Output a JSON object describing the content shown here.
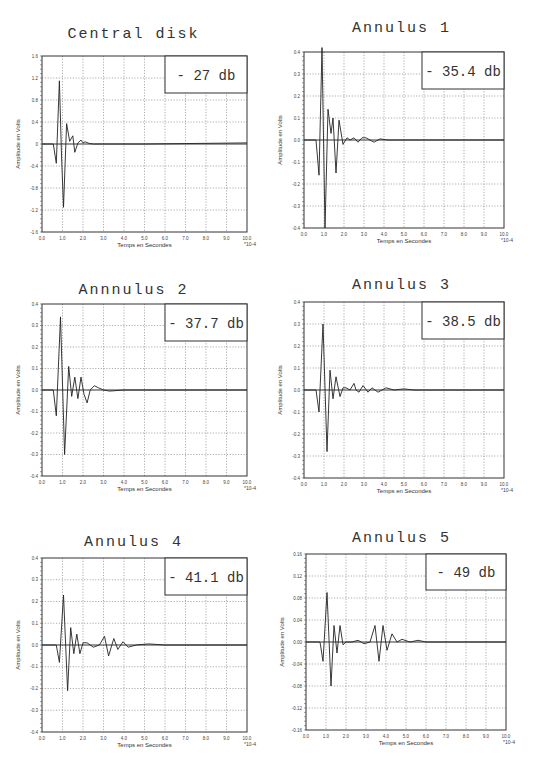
{
  "figure": {
    "xlabel": "Temps en Secondes",
    "ylabel": "Amplitude en Volts",
    "x_multiplier": "*10^-4"
  },
  "chart_data": [
    {
      "type": "line",
      "title": "Central disk",
      "annotation": "- 27 db",
      "xlabel": "Temps en Secondes",
      "ylabel": "Amplitude en Volts",
      "x_multiplier": "*10^-4",
      "xlim": [
        0,
        10
      ],
      "ylim": [
        -1.6,
        1.6
      ],
      "xticks": [
        "0.0",
        "1.0",
        "2.0",
        "3.0",
        "4.0",
        "5.0",
        "6.0",
        "7.0",
        "8.0",
        "9.0",
        "10.0"
      ],
      "yticks": [
        "1.6",
        "1.2",
        "0.8",
        "0.4",
        "0",
        "-0.4",
        "-0.8",
        "-1.2",
        "-1.6"
      ],
      "grid": true,
      "series": [
        {
          "name": "signal",
          "x": [
            0,
            0.55,
            0.7,
            0.85,
            0.95,
            1.05,
            1.2,
            1.35,
            1.5,
            1.6,
            1.75,
            1.9,
            2.0,
            2.1,
            2.3,
            2.5,
            3,
            5,
            10
          ],
          "y": [
            0,
            0,
            -0.35,
            1.15,
            -0.2,
            -1.15,
            0.37,
            0.05,
            0.15,
            -0.15,
            0.02,
            0.07,
            0.02,
            0.04,
            0.01,
            0,
            0,
            0,
            0.02
          ]
        }
      ]
    },
    {
      "type": "line",
      "title": "Annulus 1",
      "annotation": "- 35.4 db",
      "xlabel": "Temps en Secondes",
      "ylabel": "Amplitude en Volts",
      "x_multiplier": "*10^-4",
      "xlim": [
        0,
        10
      ],
      "ylim": [
        -0.4,
        0.4
      ],
      "xticks": [
        "0.0",
        "1.0",
        "2.0",
        "3.0",
        "4.0",
        "5.0",
        "6.0",
        "7.0",
        "8.0",
        "9.0",
        "10.0"
      ],
      "yticks": [
        "0.4",
        "0.3",
        "0.2",
        "0.1",
        "0.0",
        "-0.1",
        "-0.2",
        "-0.3",
        "-0.4"
      ],
      "grid": true,
      "series": [
        {
          "name": "signal",
          "x": [
            0,
            0.6,
            0.75,
            0.9,
            1.05,
            1.2,
            1.35,
            1.45,
            1.6,
            1.75,
            1.95,
            2.15,
            2.3,
            2.5,
            2.7,
            2.9,
            3.1,
            3.3,
            3.5,
            3.8,
            4.2,
            10
          ],
          "y": [
            0,
            0,
            -0.16,
            0.42,
            -0.4,
            0.14,
            0.03,
            0.1,
            -0.15,
            0.09,
            -0.02,
            0.01,
            0,
            0.01,
            -0.01,
            0.01,
            0.01,
            0,
            -0.01,
            0.005,
            0,
            0
          ]
        }
      ]
    },
    {
      "type": "line",
      "title": "Annnulus 2",
      "annotation": "- 37.7 db",
      "xlabel": "Temps en Secondes",
      "ylabel": "Amplitude en Volts",
      "x_multiplier": "*10^-4",
      "xlim": [
        0,
        10
      ],
      "ylim": [
        -0.4,
        0.4
      ],
      "xticks": [
        "0.0",
        "1.0",
        "2.0",
        "3.0",
        "4.0",
        "5.0",
        "6.0",
        "7.0",
        "8.0",
        "9.0",
        "10.0"
      ],
      "yticks": [
        "0.4",
        "0.3",
        "0.2",
        "0.1",
        "0.0",
        "-0.1",
        "-0.2",
        "-0.3",
        "-0.4"
      ],
      "grid": true,
      "series": [
        {
          "name": "signal",
          "x": [
            0,
            0.55,
            0.7,
            0.9,
            1.1,
            1.3,
            1.45,
            1.6,
            1.75,
            1.9,
            2.05,
            2.2,
            2.35,
            2.55,
            2.75,
            3,
            3.3,
            4,
            10
          ],
          "y": [
            0,
            0,
            -0.12,
            0.34,
            -0.3,
            0.11,
            -0.03,
            0.06,
            -0.04,
            0.06,
            -0.02,
            -0.06,
            0,
            0.02,
            0.01,
            0,
            -0.005,
            0,
            0
          ]
        }
      ]
    },
    {
      "type": "line",
      "title": "Annulus 3",
      "annotation": "- 38.5 db",
      "xlabel": "Temps en Secondes",
      "ylabel": "Amplitude en Volts",
      "x_multiplier": "*10^-4",
      "xlim": [
        0,
        10
      ],
      "ylim": [
        -0.4,
        0.4
      ],
      "xticks": [
        "0.0",
        "1.0",
        "2.0",
        "3.0",
        "4.0",
        "5.0",
        "6.0",
        "7.0",
        "8.0",
        "9.0",
        "10.0"
      ],
      "yticks": [
        "0.4",
        "0.3",
        "0.2",
        "0.1",
        "0.0",
        "-0.1",
        "-0.2",
        "-0.3",
        "-0.4"
      ],
      "grid": true,
      "series": [
        {
          "name": "signal",
          "x": [
            0,
            0.6,
            0.75,
            0.95,
            1.15,
            1.3,
            1.45,
            1.6,
            1.8,
            1.95,
            2.1,
            2.3,
            2.5,
            2.6,
            2.75,
            2.95,
            3.2,
            3.4,
            3.7,
            4.1,
            4.5,
            5.0,
            5.5,
            6.0,
            10
          ],
          "y": [
            0,
            0,
            -0.1,
            0.3,
            -0.28,
            0.09,
            -0.04,
            0.06,
            -0.03,
            0.01,
            0.01,
            0,
            0.03,
            0,
            -0.01,
            0.02,
            -0.01,
            0.01,
            -0.01,
            0.01,
            0,
            0.005,
            0,
            0,
            0
          ]
        }
      ]
    },
    {
      "type": "line",
      "title": "Annulus 4",
      "annotation": "- 41.1 db",
      "xlabel": "Temps en Secondes",
      "ylabel": "Amplitude en Volts",
      "x_multiplier": "*10^-4",
      "xlim": [
        0,
        10
      ],
      "ylim": [
        -0.4,
        0.4
      ],
      "xticks": [
        "0.0",
        "1.0",
        "2.0",
        "3.0",
        "4.0",
        "5.0",
        "6.0",
        "7.0",
        "8.0",
        "9.0",
        "10.0"
      ],
      "yticks": [
        "0.4",
        "0.3",
        "0.2",
        "0.1",
        "0.0",
        "-0.1",
        "-0.2",
        "-0.3",
        "-0.4"
      ],
      "grid": true,
      "series": [
        {
          "name": "signal",
          "x": [
            0,
            0.7,
            0.85,
            1.05,
            1.25,
            1.4,
            1.55,
            1.7,
            1.85,
            2.0,
            2.2,
            2.5,
            2.8,
            3.05,
            3.25,
            3.5,
            3.7,
            3.95,
            4.2,
            4.6,
            5.2,
            6.0,
            10
          ],
          "y": [
            0,
            0,
            -0.08,
            0.23,
            -0.21,
            0.08,
            -0.04,
            0.05,
            -0.04,
            0.01,
            0.01,
            -0.01,
            0,
            0.04,
            -0.05,
            0.03,
            -0.02,
            0.015,
            -0.01,
            0,
            0.005,
            0,
            0
          ]
        }
      ]
    },
    {
      "type": "line",
      "title": "Annulus 5",
      "annotation": "- 49 db",
      "xlabel": "Temps en Secondes",
      "ylabel": "Amplitude en Volts",
      "x_multiplier": "*10^-4",
      "xlim": [
        0,
        10
      ],
      "ylim": [
        -0.16,
        0.16
      ],
      "xticks": [
        "0.0",
        "1.0",
        "2.0",
        "3.0",
        "4.0",
        "5.0",
        "6.0",
        "7.0",
        "8.0",
        "9.0",
        "10.0"
      ],
      "yticks": [
        "0.16",
        "0.12",
        "0.08",
        "0.04",
        "0.00",
        "-0.04",
        "-0.08",
        "-0.12",
        "-0.16"
      ],
      "grid": true,
      "series": [
        {
          "name": "signal",
          "x": [
            0,
            0.7,
            0.85,
            1.05,
            1.25,
            1.4,
            1.55,
            1.7,
            1.85,
            2.0,
            2.3,
            2.6,
            2.9,
            3.2,
            3.45,
            3.65,
            3.85,
            4.05,
            4.3,
            4.55,
            4.8,
            5.2,
            5.6,
            6.0,
            10
          ],
          "y": [
            0,
            0,
            -0.035,
            0.09,
            -0.08,
            0.03,
            -0.02,
            0.03,
            -0.005,
            0,
            0,
            0.003,
            -0.003,
            0,
            0.03,
            -0.035,
            0.03,
            -0.015,
            0.015,
            0,
            0.005,
            0,
            0.003,
            0,
            0
          ]
        }
      ]
    }
  ]
}
